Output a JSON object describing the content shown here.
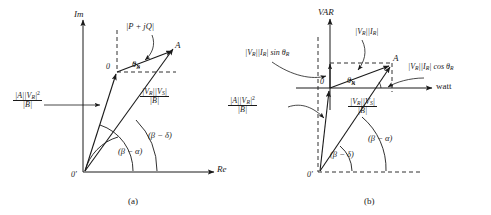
{
  "figure": {
    "type": "phasor-power-circle-diagram",
    "panels": [
      {
        "id": "a",
        "caption": "(a)",
        "axes": {
          "vertical": "Im",
          "horizontal": "Re"
        },
        "origin_outer": "0'",
        "origin_inner": "0",
        "point_label": "A",
        "angle_inner_label": "(β − α)",
        "angle_outer_label": "(β − δ)",
        "theta_label": "θ",
        "theta_sub": "R",
        "labels": {
          "resultant": {
            "text": "|P + jQ|"
          },
          "offset_fraction": {
            "numerator_pre": "|A||V",
            "numerator_sub": "R",
            "numerator_post": "|",
            "numerator_sup": "2",
            "denominator": "|B|"
          },
          "main_fraction": {
            "numerator_pre": "|V",
            "numerator_sub1": "R",
            "numerator_mid": "||V",
            "numerator_sub2": "S",
            "numerator_post": "|",
            "denominator": "|B|"
          }
        }
      },
      {
        "id": "b",
        "caption": "(b)",
        "axes": {
          "vertical": "VAR",
          "horizontal": "watt"
        },
        "origin_outer": "0'",
        "origin_inner": "0",
        "point_label": "A",
        "angle_inner_label": "(β − δ)",
        "angle_outer_label": "(β − α)",
        "theta_label": "θ",
        "theta_sub": "R",
        "labels": {
          "reactive": {
            "pre": "|V",
            "sub1": "R",
            "mid": "||I",
            "sub2": "R",
            "post": "| sin θ",
            "sub3": "R"
          },
          "apparent": {
            "pre": "|V",
            "sub1": "R",
            "mid": "||I",
            "sub2": "R",
            "post": "|"
          },
          "real": {
            "pre": "|V",
            "sub1": "R",
            "mid": "||I",
            "sub2": "R",
            "post": "| cos θ",
            "sub3": "R"
          },
          "offset_fraction": {
            "numerator_pre": "|A||V",
            "numerator_sub": "R",
            "numerator_post": "|",
            "numerator_sup": "2",
            "denominator": "|B|"
          },
          "main_fraction": {
            "numerator_pre": "|V",
            "numerator_sub1": "R",
            "numerator_mid": "||V",
            "numerator_sub2": "S",
            "numerator_post": "|",
            "denominator": "|B|"
          }
        }
      }
    ]
  },
  "style": {
    "ink": "#1a1a1a",
    "background": "#ffffff"
  }
}
